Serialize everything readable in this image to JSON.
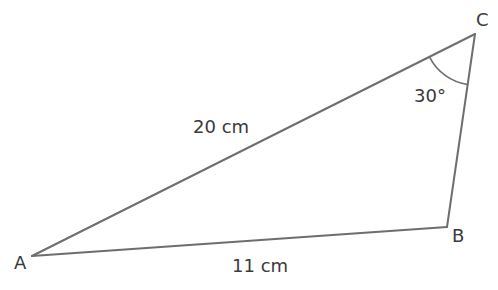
{
  "diagram": {
    "type": "triangle",
    "stroke_color": "#6e6e6e",
    "text_color": "#3a3a3a",
    "vertices": [
      {
        "id": "A",
        "label": "A",
        "x": 32,
        "y": 256
      },
      {
        "id": "B",
        "label": "B",
        "x": 447,
        "y": 227
      },
      {
        "id": "C",
        "label": "C",
        "x": 475,
        "y": 34
      }
    ],
    "sides": [
      {
        "from": "A",
        "to": "C",
        "label": "20 cm"
      },
      {
        "from": "A",
        "to": "B",
        "label": "11 cm"
      },
      {
        "from": "B",
        "to": "C",
        "label": ""
      }
    ],
    "angles": [
      {
        "at": "C",
        "label": "30°"
      }
    ]
  }
}
